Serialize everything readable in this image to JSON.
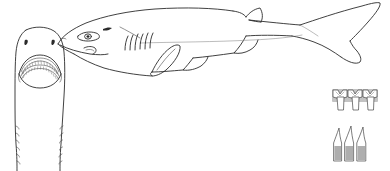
{
  "plate": {
    "title": "Sixgill shark identification plate",
    "subject": "shark",
    "background_color": "#ffffff",
    "ink_color": "#2b2b2b",
    "stipple_color": "#b9b9b9",
    "style": "black-and-white scientific line drawing",
    "labels": []
  },
  "figures": [
    {
      "id": "ventral-head",
      "name": "Ventral view of head",
      "position": "left",
      "features": [
        {
          "name": "snout",
          "shape": "broadly rounded"
        },
        {
          "name": "nostril-left",
          "count": 1
        },
        {
          "name": "nostril-right",
          "count": 1
        },
        {
          "name": "mouth",
          "shape": "wide arched crescent"
        },
        {
          "name": "upper-tooth-row",
          "description": "fine serrated tooth band"
        },
        {
          "name": "lower-tooth-row",
          "description": "comb-like cockscomb teeth"
        },
        {
          "name": "gill-slits-left",
          "count": 6
        },
        {
          "name": "gill-slits-right",
          "count": 6
        }
      ]
    },
    {
      "id": "lateral-body",
      "name": "Lateral view of whole shark",
      "position": "center-right",
      "features": [
        {
          "name": "eye",
          "shape": "large oval with pupil"
        },
        {
          "name": "spiracle",
          "shape": "small dark slit behind eye"
        },
        {
          "name": "labial-furrow",
          "shape": "short curved groove at mouth corner"
        },
        {
          "name": "gill-slits",
          "count": 6
        },
        {
          "name": "pectoral-fin",
          "count": 1
        },
        {
          "name": "dorsal-fin",
          "count": 1,
          "note": "single, set far back near tail"
        },
        {
          "name": "pelvic-fin",
          "count": 1
        },
        {
          "name": "anal-fin",
          "count": 1
        },
        {
          "name": "caudal-fin",
          "shape": "heterocercal, long upper lobe with subterminal notch"
        },
        {
          "name": "lateral-line",
          "shape": "faint line along flank"
        }
      ]
    },
    {
      "id": "upper-teeth",
      "name": "Upper teeth detail",
      "position": "lower-right-upper",
      "tooth_count": 3,
      "description": "broad-rooted teeth with small hooked cusp and shouldered crown"
    },
    {
      "id": "lower-teeth",
      "name": "Lower teeth detail",
      "position": "lower-right-lower",
      "tooth_count": 3,
      "description": "tall awl-shaped cusps on wide stippled bases"
    }
  ]
}
